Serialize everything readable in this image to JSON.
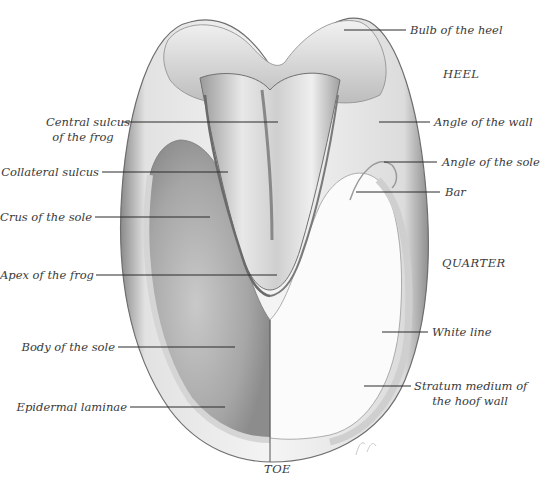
{
  "figure": {
    "regions": {
      "heel": "HEEL",
      "quarter": "QUARTER",
      "toe": "TOE"
    },
    "labels_left": [
      {
        "id": "central-sulcus",
        "line1": "Central sulcus",
        "line2": "of the frog"
      },
      {
        "id": "collateral-sulcus",
        "line1": "Collateral sulcus"
      },
      {
        "id": "crus-of-sole",
        "line1": "Crus of the sole"
      },
      {
        "id": "apex-of-frog",
        "line1": "Apex of the frog"
      },
      {
        "id": "body-of-sole",
        "line1": "Body of the sole"
      },
      {
        "id": "epidermal-laminae",
        "line1": "Epidermal laminae"
      }
    ],
    "labels_right": [
      {
        "id": "bulb-of-heel",
        "line1": "Bulb of the heel"
      },
      {
        "id": "angle-of-wall",
        "line1": "Angle of the wall"
      },
      {
        "id": "angle-of-sole",
        "line1": "Angle of the sole"
      },
      {
        "id": "bar",
        "line1": "Bar"
      },
      {
        "id": "white-line",
        "line1": "White line"
      },
      {
        "id": "stratum-medium",
        "line1": "Stratum medium of",
        "line2": "the hoof wall"
      }
    ],
    "colors": {
      "ink": "#3a3a3a",
      "leader": "#2b2b2b",
      "shade_dark": "#7d7d7d",
      "shade_mid": "#b5b5b5",
      "shade_light": "#e6e6e6"
    }
  }
}
